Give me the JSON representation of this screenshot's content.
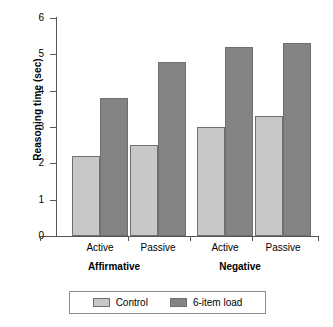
{
  "chart_data": {
    "type": "bar",
    "title": "",
    "xlabel": "",
    "ylabel": "Reasoning time (sec)",
    "ylim": [
      0,
      6
    ],
    "yticks": [
      "0",
      "1",
      "2",
      "3",
      "4",
      "5",
      "6"
    ],
    "grid": false,
    "legend_position": "bottom",
    "categories": [
      "Active",
      "Passive",
      "Active",
      "Passive"
    ],
    "groups": [
      {
        "label": "Affirmative",
        "categories": [
          "Active",
          "Passive"
        ]
      },
      {
        "label": "Negative",
        "categories": [
          "Active",
          "Passive"
        ]
      }
    ],
    "series": [
      {
        "name": "Control",
        "color": "#c8c8c8",
        "values": [
          2.2,
          2.5,
          3.0,
          3.3
        ]
      },
      {
        "name": "6-item load",
        "color": "#838383",
        "values": [
          3.8,
          4.8,
          5.2,
          5.3
        ]
      }
    ]
  },
  "axes": {
    "y_title": "Reasoning time (sec)",
    "y_tick_labels": [
      "6",
      "5",
      "4",
      "3",
      "2",
      "1",
      "0"
    ]
  },
  "category_labels": [
    "Active",
    "Passive",
    "Active",
    "Passive"
  ],
  "group_labels": [
    "Affirmative",
    "Negative"
  ],
  "legend": {
    "items": [
      {
        "label": "Control",
        "color": "#c8c8c8"
      },
      {
        "label": "6-item load",
        "color": "#838383"
      }
    ]
  }
}
